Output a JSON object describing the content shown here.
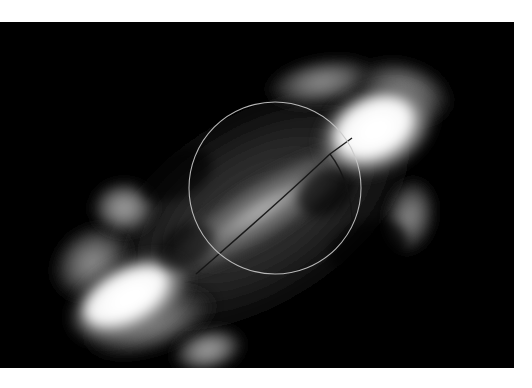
{
  "figure": {
    "kind": "grayscale-intensity-map",
    "background_color": "#000000",
    "page_background_color": "#ffffff",
    "frame": {
      "x": 0,
      "y": 22,
      "width": 514,
      "height": 346
    }
  },
  "chart_data": {
    "type": "heatmap",
    "title": "",
    "subtitle": "",
    "xlabel": "",
    "ylabel": "",
    "grid": false,
    "legend": "none",
    "colormap": "grayscale",
    "colormap_stops": [
      {
        "level": 0.0,
        "color": "#000000",
        "label": "background"
      },
      {
        "level": 0.18,
        "color": "#1a1a1a",
        "label": "faint halo"
      },
      {
        "level": 0.32,
        "color": "#3a3a3a",
        "label": "low emission"
      },
      {
        "level": 0.48,
        "color": "#6e6e6e",
        "label": "mid emission"
      },
      {
        "level": 0.62,
        "color": "#9a9a9a",
        "label": "bridge"
      },
      {
        "level": 0.78,
        "color": "#c8c8c8",
        "label": "bright"
      },
      {
        "level": 0.92,
        "color": "#ececec",
        "label": "very bright"
      },
      {
        "level": 1.0,
        "color": "#ffffff",
        "label": "peak"
      }
    ],
    "axis_ranges": {
      "xlim": [
        0,
        514
      ],
      "ylim": [
        0,
        346
      ]
    },
    "source_axis_angle_deg": -32,
    "features": [
      {
        "name": "northeast-lobe",
        "type": "bright-lobe",
        "center": [
          378,
          105
        ],
        "radii": [
          62,
          42
        ],
        "rotation_deg": -28,
        "peak_intensity": 1.0
      },
      {
        "name": "southwest-lobe",
        "type": "bright-lobe",
        "center": [
          128,
          277
        ],
        "radii": [
          66,
          38
        ],
        "rotation_deg": -30,
        "peak_intensity": 1.0
      },
      {
        "name": "central-bridge",
        "type": "connecting-bridge",
        "center": [
          262,
          188
        ],
        "radii": [
          118,
          30
        ],
        "rotation_deg": -32,
        "peak_intensity": 0.72
      },
      {
        "name": "northeast-extension",
        "type": "diffuse-extension",
        "center": [
          318,
          62
        ],
        "radii": [
          58,
          26
        ],
        "rotation_deg": -12,
        "peak_intensity": 0.44
      },
      {
        "name": "east-spur",
        "type": "diffuse-spur",
        "center": [
          412,
          196
        ],
        "radii": [
          26,
          38
        ],
        "rotation_deg": 8,
        "peak_intensity": 0.4
      },
      {
        "name": "west-knot",
        "type": "compact-knot",
        "center": [
          124,
          186
        ],
        "radii": [
          30,
          26
        ],
        "rotation_deg": 0,
        "peak_intensity": 0.45
      },
      {
        "name": "south-knot",
        "type": "compact-knot",
        "center": [
          208,
          330
        ],
        "radii": [
          32,
          20
        ],
        "rotation_deg": -14,
        "peak_intensity": 0.46
      },
      {
        "name": "outer-halo",
        "type": "low-level-envelope",
        "center": [
          256,
          188
        ],
        "radii": [
          210,
          118
        ],
        "rotation_deg": -32,
        "peak_intensity": 0.22
      }
    ],
    "overlays": [
      {
        "name": "aperture-circle",
        "type": "circle",
        "center": [
          275,
          188
        ],
        "radius": 86,
        "stroke_color": "#c9c9c9",
        "stroke_width": 1.1,
        "fill": "none"
      },
      {
        "name": "contour-line",
        "type": "polyline",
        "stroke_color": "#141414",
        "stroke_width": 1.2,
        "points": [
          [
            200,
            250
          ],
          [
            248,
            208
          ],
          [
            300,
            160
          ],
          [
            335,
            128
          ],
          [
            352,
            116
          ]
        ]
      }
    ]
  },
  "overlay_labels": {
    "aperture_name": "aperture-circle",
    "contour_name": "contour-line"
  }
}
